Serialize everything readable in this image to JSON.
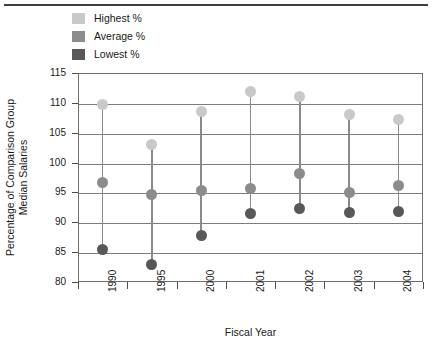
{
  "chart_data": {
    "type": "scatter",
    "title": "",
    "xlabel": "Fiscal Year",
    "ylabel": "Percentage of Comparison Group Median Salaries",
    "ylabel_line1": "Percentage of Comparison Group",
    "ylabel_line2": "Median Salaries",
    "categories": [
      "1990",
      "1995",
      "2000",
      "2001",
      "2002",
      "2003",
      "2004"
    ],
    "ylim": [
      80,
      115
    ],
    "yticks": [
      115,
      110,
      105,
      100,
      95,
      90,
      85,
      80
    ],
    "ytick_labels": [
      "115",
      "110",
      "105",
      "100",
      "95",
      "90",
      "85",
      "80"
    ],
    "grid": true,
    "legend_position": "top-left-outside",
    "series": [
      {
        "name": "Highest %",
        "color": "#c9c9c9",
        "values": [
          109.7,
          103.0,
          108.5,
          111.9,
          111.0,
          108.1,
          107.2
        ]
      },
      {
        "name": "Average %",
        "color": "#8c8c8c",
        "values": [
          96.6,
          94.6,
          95.3,
          95.6,
          98.2,
          95.0,
          96.1
        ]
      },
      {
        "name": "Lowest %",
        "color": "#585858",
        "values": [
          85.5,
          82.9,
          87.8,
          91.5,
          92.3,
          91.7,
          91.8
        ]
      }
    ]
  },
  "legend": {
    "items": [
      {
        "label": "Highest %",
        "color": "#c9c9c9"
      },
      {
        "label": "Average %",
        "color": "#8c8c8c"
      },
      {
        "label": "Lowest %",
        "color": "#585858"
      }
    ]
  },
  "colors": {
    "highest": "#c9c9c9",
    "average": "#8c8c8c",
    "lowest": "#585858",
    "stem": "#8a8a8a",
    "grid": "#7d7d7d",
    "frame": "#6e6e6e",
    "rule": "#3d3d3d",
    "text": "#1a1a1a"
  }
}
